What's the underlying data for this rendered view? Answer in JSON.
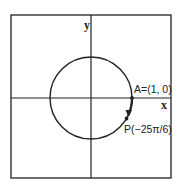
{
  "diagram": {
    "type": "unit-circle",
    "axes": {
      "x_label": "x",
      "y_label": "y"
    },
    "points": [
      {
        "id": "A",
        "label": "A=(1, 0)",
        "angle_rad": 0
      },
      {
        "id": "P",
        "label": "P(−25π/6)",
        "angle_rad": -0.5236
      }
    ],
    "arrow": {
      "from": "A",
      "to": "P",
      "direction": "clockwise"
    },
    "colors": {
      "stroke": "#222222",
      "background": "#ffffff"
    }
  }
}
